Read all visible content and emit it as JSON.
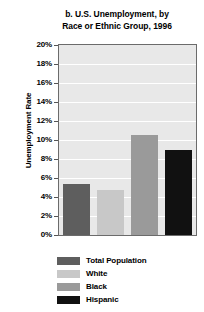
{
  "chart_data": {
    "type": "bar",
    "title": "b. U.S. Unemployment, by Race or Ethnic Group, 1996",
    "title_lines": [
      "b. U.S. Unemployment, by",
      "Race or Ethnic Group, 1996"
    ],
    "xlabel": "",
    "ylabel": "Unemployment Rate",
    "categories": [
      "Total Population",
      "White",
      "Black",
      "Hispanic"
    ],
    "values": [
      5.4,
      4.7,
      10.5,
      8.9
    ],
    "ylim": [
      0,
      20
    ],
    "ytick_step": 2,
    "ytick_labels": [
      "0%",
      "2%",
      "4%",
      "6%",
      "8%",
      "10%",
      "12%",
      "14%",
      "16%",
      "18%",
      "20%"
    ],
    "ytick_values": [
      0,
      2,
      4,
      6,
      8,
      10,
      12,
      14,
      16,
      18,
      20
    ],
    "grid": true,
    "legend_position": "below",
    "series_colors": [
      "#5e5e5e",
      "#c8c8c8",
      "#9a9a9a",
      "#111111"
    ],
    "legend": [
      {
        "label": "Total Population",
        "color": "#5e5e5e"
      },
      {
        "label": "White",
        "color": "#c8c8c8"
      },
      {
        "label": "Black",
        "color": "#9a9a9a"
      },
      {
        "label": "Hispanic",
        "color": "#111111"
      }
    ],
    "plot_background": "#e8e8e8",
    "gridline_color": "#ffffff",
    "axis_color": "#6b6b6b"
  }
}
